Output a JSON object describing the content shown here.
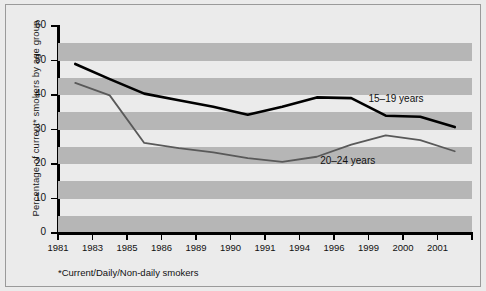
{
  "chart_data": {
    "type": "line",
    "title": "",
    "subtitle": "",
    "xlabel": "",
    "ylabel": "Percentage of current* smokers by age group",
    "footnote": "*Current/Daily/Non-daily smokers",
    "categories": [
      "1981",
      "1983",
      "1985",
      "1986",
      "1989",
      "1990",
      "1991",
      "1994",
      "1996",
      "1999",
      "2000",
      "2001"
    ],
    "x_tick_labels": [
      "1981",
      "1983",
      "1985",
      "1986",
      "1989",
      "1990",
      "1991",
      "1994",
      "1996",
      "1999",
      "2000",
      "2001"
    ],
    "y_tick_labels": [
      "0",
      "10",
      "20",
      "30",
      "40",
      "50",
      "60"
    ],
    "y_ticks": [
      0,
      10,
      20,
      30,
      40,
      50,
      60
    ],
    "ylim": [
      0,
      60
    ],
    "grid": "horizontal-alternating-bands",
    "band_interval": 5,
    "legend_position": "inline-annotations",
    "series": [
      {
        "name": "15–19 years",
        "color": "#000000",
        "line_width": 2.6,
        "annotation": "15–19 years",
        "points": [
          {
            "x": 0.5,
            "value": 49.0
          },
          {
            "x": 1.5,
            "value": 44.6
          },
          {
            "x": 2.5,
            "value": 40.4
          },
          {
            "x": 3.5,
            "value": 38.5
          },
          {
            "x": 4.5,
            "value": 36.6
          },
          {
            "x": 5.5,
            "value": 34.3
          },
          {
            "x": 6.5,
            "value": 36.6
          },
          {
            "x": 7.5,
            "value": 39.3
          },
          {
            "x": 8.5,
            "value": 39.1
          },
          {
            "x": 9.5,
            "value": 34.0
          },
          {
            "x": 10.5,
            "value": 33.7
          },
          {
            "x": 11.5,
            "value": 30.7
          }
        ],
        "values": [
          49.0,
          44.6,
          40.4,
          38.5,
          36.6,
          34.3,
          36.6,
          39.3,
          39.1,
          34.0,
          33.7,
          30.7
        ]
      },
      {
        "name": "20–24 years",
        "color": "#595959",
        "line_width": 1.8,
        "annotation": "20–24 years",
        "points": [
          {
            "x": 0.5,
            "value": 43.5
          },
          {
            "x": 1.5,
            "value": 39.9
          },
          {
            "x": 2.5,
            "value": 26.1
          },
          {
            "x": 3.5,
            "value": 24.6
          },
          {
            "x": 4.5,
            "value": 23.4
          },
          {
            "x": 5.5,
            "value": 21.7
          },
          {
            "x": 6.5,
            "value": 20.6
          },
          {
            "x": 7.5,
            "value": 22.1
          },
          {
            "x": 8.5,
            "value": 25.6
          },
          {
            "x": 9.5,
            "value": 28.3
          },
          {
            "x": 10.5,
            "value": 26.9
          },
          {
            "x": 11.5,
            "value": 23.7
          }
        ],
        "values": [
          43.5,
          39.9,
          26.1,
          24.6,
          23.4,
          21.7,
          20.6,
          22.1,
          25.6,
          28.3,
          26.9,
          23.7
        ]
      }
    ],
    "annotations": [
      {
        "text": "15–19 years",
        "series": "15–19 years"
      },
      {
        "text": "20–24 years",
        "series": "20–24 years"
      }
    ]
  }
}
